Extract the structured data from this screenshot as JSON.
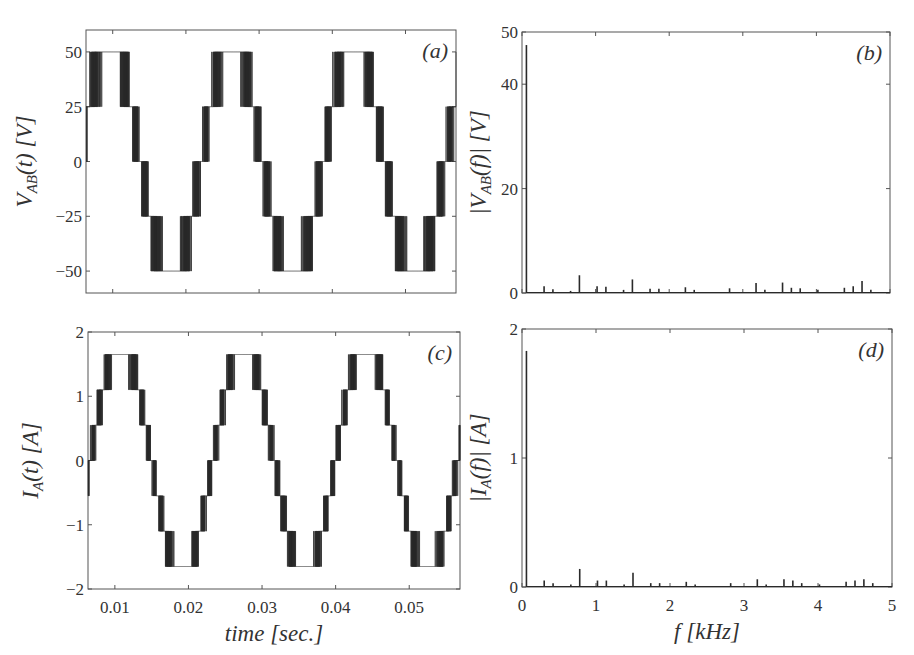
{
  "chart_data": [
    {
      "id": "a",
      "type": "line",
      "panel_label": "(a)",
      "title": "",
      "xlabel": "",
      "ylabel": "V_AB(t) [V]",
      "ylabel_parts": {
        "main": "V",
        "sub": "AB",
        "rest": "(t) [V]"
      },
      "xlim": [
        0.00635,
        0.0569
      ],
      "ylim": [
        -60,
        60
      ],
      "yticks": [
        50,
        25,
        0,
        -25,
        -50
      ],
      "ytick_labels": [
        "50",
        "25",
        "0",
        "−25",
        "−50"
      ],
      "xticks": [
        0.01,
        0.02,
        0.03,
        0.04,
        0.05
      ],
      "show_xtick_labels": false,
      "grid": false,
      "description": "Five-level multilevel inverter line-to-line voltage, PWM-switched staircase, 60 Hz fundamental",
      "waveform": {
        "fundamental_hz": 60,
        "phase_peak_time": 0.0096,
        "levels": [
          -50,
          -25,
          0,
          25,
          50
        ],
        "amplitude": 50,
        "switching": "pwm"
      }
    },
    {
      "id": "b",
      "type": "bar",
      "panel_label": "(b)",
      "xlabel": "",
      "ylabel": "|V_AB(f)| [V]",
      "ylabel_parts": {
        "main": "|V",
        "sub": "AB",
        "rest": "(f)| [V]"
      },
      "xlim": [
        0,
        5
      ],
      "ylim": [
        0,
        50
      ],
      "yticks": [
        0,
        20,
        40,
        50
      ],
      "ytick_labels": [
        "0",
        "20",
        "40",
        "50"
      ],
      "xticks": [
        0,
        1,
        2,
        3,
        4,
        5
      ],
      "show_xtick_labels": false,
      "grid": false,
      "x_unit": "kHz",
      "spikes": [
        {
          "f": 0.06,
          "mag": 47.5
        },
        {
          "f": 0.3,
          "mag": 1.3
        },
        {
          "f": 0.42,
          "mag": 0.7
        },
        {
          "f": 0.66,
          "mag": 0.4
        },
        {
          "f": 0.78,
          "mag": 3.4
        },
        {
          "f": 1.02,
          "mag": 1.3
        },
        {
          "f": 1.14,
          "mag": 1.2
        },
        {
          "f": 1.38,
          "mag": 0.6
        },
        {
          "f": 1.5,
          "mag": 2.6
        },
        {
          "f": 1.74,
          "mag": 0.8
        },
        {
          "f": 1.86,
          "mag": 0.8
        },
        {
          "f": 2.22,
          "mag": 1.1
        },
        {
          "f": 2.34,
          "mag": 0.6
        },
        {
          "f": 2.82,
          "mag": 0.9
        },
        {
          "f": 3.18,
          "mag": 1.9
        },
        {
          "f": 3.3,
          "mag": 0.6
        },
        {
          "f": 3.54,
          "mag": 2.0
        },
        {
          "f": 3.66,
          "mag": 1.0
        },
        {
          "f": 3.78,
          "mag": 0.9
        },
        {
          "f": 4.02,
          "mag": 0.6
        },
        {
          "f": 4.38,
          "mag": 1.0
        },
        {
          "f": 4.5,
          "mag": 1.3
        },
        {
          "f": 4.62,
          "mag": 2.3
        },
        {
          "f": 4.74,
          "mag": 0.6
        }
      ]
    },
    {
      "id": "c",
      "type": "line",
      "panel_label": "(c)",
      "xlabel": "time [sec.]",
      "ylabel": "I_A(t) [A]",
      "ylabel_parts": {
        "main": "I",
        "sub": "A",
        "rest": "(t) [A]"
      },
      "xlim": [
        0.00635,
        0.0569
      ],
      "ylim": [
        -2,
        2
      ],
      "yticks": [
        2,
        1,
        0,
        -1,
        -2
      ],
      "ytick_labels": [
        "2",
        "1",
        "0",
        "−1",
        "−2"
      ],
      "xticks": [
        0.01,
        0.02,
        0.03,
        0.04,
        0.05
      ],
      "xtick_labels": [
        "0.01",
        "0.02",
        "0.03",
        "0.04",
        "0.05"
      ],
      "show_xtick_labels": true,
      "grid": false,
      "description": "Phase A current, seven-level PWM staircase, 60 Hz fundamental",
      "waveform": {
        "fundamental_hz": 60,
        "phase_peak_time": 0.0108,
        "levels": [
          -1.65,
          -1.1,
          -0.55,
          0,
          0.55,
          1.1,
          1.65
        ],
        "amplitude": 1.65,
        "switching": "pwm"
      }
    },
    {
      "id": "d",
      "type": "bar",
      "panel_label": "(d)",
      "xlabel": "f [kHz]",
      "ylabel": "|I_A(f)| [A]",
      "ylabel_parts": {
        "main": "|I",
        "sub": "A",
        "rest": "(f)| [A]"
      },
      "xlim": [
        0,
        5
      ],
      "ylim": [
        0,
        2
      ],
      "yticks": [
        0,
        1,
        2
      ],
      "ytick_labels": [
        "0",
        "1",
        "2"
      ],
      "xticks": [
        0,
        1,
        2,
        3,
        4,
        5
      ],
      "xtick_labels": [
        "0",
        "1",
        "2",
        "3",
        "4",
        "5"
      ],
      "show_xtick_labels": true,
      "grid": false,
      "x_unit": "kHz",
      "spikes": [
        {
          "f": 0.06,
          "mag": 1.83
        },
        {
          "f": 0.3,
          "mag": 0.05
        },
        {
          "f": 0.42,
          "mag": 0.03
        },
        {
          "f": 0.66,
          "mag": 0.02
        },
        {
          "f": 0.78,
          "mag": 0.14
        },
        {
          "f": 1.02,
          "mag": 0.05
        },
        {
          "f": 1.14,
          "mag": 0.05
        },
        {
          "f": 1.38,
          "mag": 0.02
        },
        {
          "f": 1.5,
          "mag": 0.11
        },
        {
          "f": 1.74,
          "mag": 0.03
        },
        {
          "f": 1.86,
          "mag": 0.03
        },
        {
          "f": 2.22,
          "mag": 0.04
        },
        {
          "f": 2.34,
          "mag": 0.02
        },
        {
          "f": 2.82,
          "mag": 0.03
        },
        {
          "f": 3.18,
          "mag": 0.06
        },
        {
          "f": 3.3,
          "mag": 0.02
        },
        {
          "f": 3.54,
          "mag": 0.06
        },
        {
          "f": 3.66,
          "mag": 0.05
        },
        {
          "f": 3.78,
          "mag": 0.03
        },
        {
          "f": 4.02,
          "mag": 0.02
        },
        {
          "f": 4.38,
          "mag": 0.04
        },
        {
          "f": 4.5,
          "mag": 0.05
        },
        {
          "f": 4.62,
          "mag": 0.06
        },
        {
          "f": 4.74,
          "mag": 0.03
        }
      ]
    }
  ],
  "layout_colors": {
    "trace": "#2a2a2a",
    "frame": "#555555",
    "text": "#333333"
  }
}
